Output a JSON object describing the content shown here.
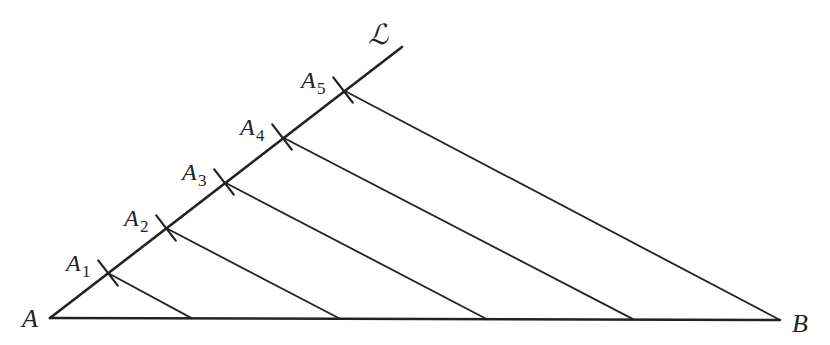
{
  "diagram": {
    "stroke_color": "#222222",
    "background": "#ffffff",
    "line_label": "ℒ",
    "point_A": {
      "label": "A",
      "x": 50,
      "y": 318
    },
    "point_B": {
      "label": "B",
      "x": 780,
      "y": 320
    },
    "line_L_end": {
      "x": 402,
      "y": 47
    },
    "points_on_L": [
      {
        "label": "A",
        "sub": "1",
        "x": 108,
        "y": 273
      },
      {
        "label": "A",
        "sub": "2",
        "x": 166,
        "y": 228
      },
      {
        "label": "A",
        "sub": "3",
        "x": 224,
        "y": 182
      },
      {
        "label": "A",
        "sub": "4",
        "x": 282,
        "y": 137
      },
      {
        "label": "A",
        "sub": "5",
        "x": 343,
        "y": 90
      }
    ],
    "points_on_AB_x": [
      192,
      340,
      487,
      634,
      780
    ]
  }
}
